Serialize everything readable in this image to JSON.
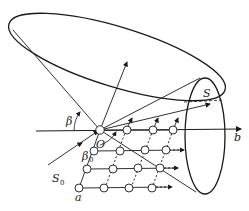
{
  "diagram": {
    "labels": {
      "origin": "O",
      "axis_b": "b",
      "axis_a": "a",
      "incident_beam": "S",
      "incident_beam_sub": "0",
      "diffracted_beam": "S",
      "angle_beta": "β",
      "angle_beta0": "β",
      "angle_beta0_sub": "0"
    },
    "colors": {
      "stroke": "#1a1a1a",
      "background": "#ffffff"
    },
    "lattice": {
      "rows": 4,
      "columns": 4
    }
  }
}
